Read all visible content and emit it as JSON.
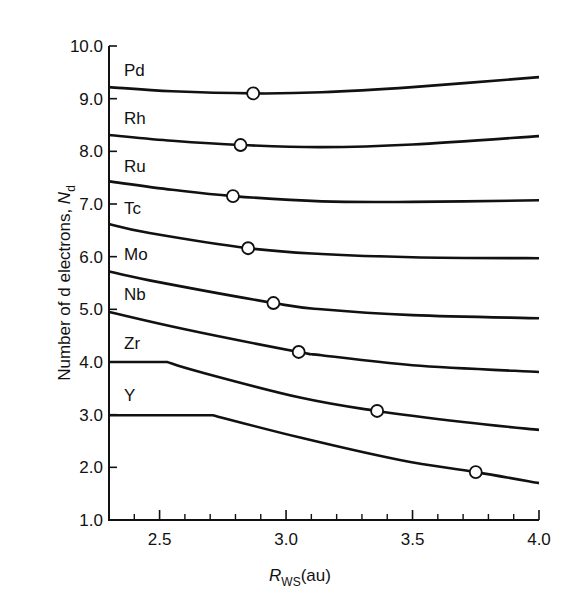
{
  "chart_data": {
    "type": "line",
    "title": "",
    "xlabel": "R_WS(au)",
    "xlabel_main": "R",
    "xlabel_sub": "WS",
    "xlabel_unit": "(au)",
    "ylabel": "Number of d electrons, N_d",
    "ylabel_main": "Number of d electrons, ",
    "ylabel_var": "N",
    "ylabel_sub": "d",
    "xlim": [
      2.3,
      4.0
    ],
    "ylim": [
      1.0,
      10.0
    ],
    "x_ticks_major": [
      2.5,
      3.0,
      3.5,
      4.0
    ],
    "x_tick_labels": [
      "2.5",
      "3.0",
      "3.5",
      "4.0"
    ],
    "x_ticks_minor": [
      2.4,
      2.6,
      2.7,
      2.8,
      2.9,
      3.1,
      3.2,
      3.3,
      3.4,
      3.6,
      3.7,
      3.8,
      3.9
    ],
    "y_ticks": [
      1.0,
      2.0,
      3.0,
      4.0,
      5.0,
      6.0,
      7.0,
      8.0,
      9.0,
      10.0
    ],
    "y_tick_labels": [
      "1.0",
      "2.0",
      "3.0",
      "4.0",
      "5.0",
      "6.0",
      "7.0",
      "8.0",
      "9.0",
      "10.0"
    ],
    "grid": false,
    "legend": "inline labels at left of each curve",
    "marker_style": "open circle",
    "line_color": "#111111",
    "series": [
      {
        "name": "Pd",
        "label_y": 9.55,
        "points": [
          [
            2.3,
            9.22
          ],
          [
            2.55,
            9.14
          ],
          [
            2.87,
            9.1
          ],
          [
            3.14,
            9.12
          ],
          [
            3.5,
            9.22
          ],
          [
            4.0,
            9.41
          ]
        ],
        "marker": [
          2.87,
          9.1
        ]
      },
      {
        "name": "Rh",
        "label_y": 8.64,
        "points": [
          [
            2.3,
            8.31
          ],
          [
            2.55,
            8.2
          ],
          [
            2.82,
            8.12
          ],
          [
            3.14,
            8.08
          ],
          [
            3.5,
            8.13
          ],
          [
            4.0,
            8.29
          ]
        ],
        "marker": [
          2.82,
          8.12
        ]
      },
      {
        "name": "Ru",
        "label_y": 7.73,
        "points": [
          [
            2.3,
            7.43
          ],
          [
            2.55,
            7.27
          ],
          [
            2.79,
            7.15
          ],
          [
            3.14,
            7.05
          ],
          [
            3.5,
            7.04
          ],
          [
            4.0,
            7.07
          ]
        ],
        "marker": [
          2.79,
          7.15
        ]
      },
      {
        "name": "Tc",
        "label_y": 6.92,
        "points": [
          [
            2.3,
            6.62
          ],
          [
            2.46,
            6.45
          ],
          [
            2.85,
            6.16
          ],
          [
            3.14,
            6.05
          ],
          [
            3.5,
            5.99
          ],
          [
            4.0,
            5.97
          ]
        ],
        "marker": [
          2.85,
          6.16
        ]
      },
      {
        "name": "Mo",
        "label_y": 6.05,
        "points": [
          [
            2.3,
            5.72
          ],
          [
            2.46,
            5.55
          ],
          [
            2.95,
            5.12
          ],
          [
            3.14,
            5.0
          ],
          [
            3.5,
            4.89
          ],
          [
            4.0,
            4.83
          ]
        ],
        "marker": [
          2.95,
          5.12
        ]
      },
      {
        "name": "Nb",
        "label_y": 5.3,
        "points": [
          [
            2.3,
            4.95
          ],
          [
            2.6,
            4.62
          ],
          [
            3.05,
            4.19
          ],
          [
            3.14,
            4.13
          ],
          [
            3.5,
            3.94
          ],
          [
            4.0,
            3.81
          ]
        ],
        "marker": [
          3.05,
          4.19
        ]
      },
      {
        "name": "Zr",
        "label_y": 4.37,
        "points": [
          [
            2.3,
            4.0
          ],
          [
            2.53,
            4.0
          ],
          [
            2.66,
            3.81
          ],
          [
            3.06,
            3.32
          ],
          [
            3.36,
            3.07
          ],
          [
            3.7,
            2.86
          ],
          [
            4.0,
            2.71
          ]
        ],
        "marker": [
          3.36,
          3.07
        ]
      },
      {
        "name": "Y",
        "label_y": 3.37,
        "points": [
          [
            2.3,
            2.99
          ],
          [
            2.71,
            2.99
          ],
          [
            3.06,
            2.56
          ],
          [
            3.45,
            2.14
          ],
          [
            3.75,
            1.91
          ],
          [
            4.0,
            1.7
          ]
        ],
        "marker": [
          3.75,
          1.91
        ]
      }
    ]
  }
}
